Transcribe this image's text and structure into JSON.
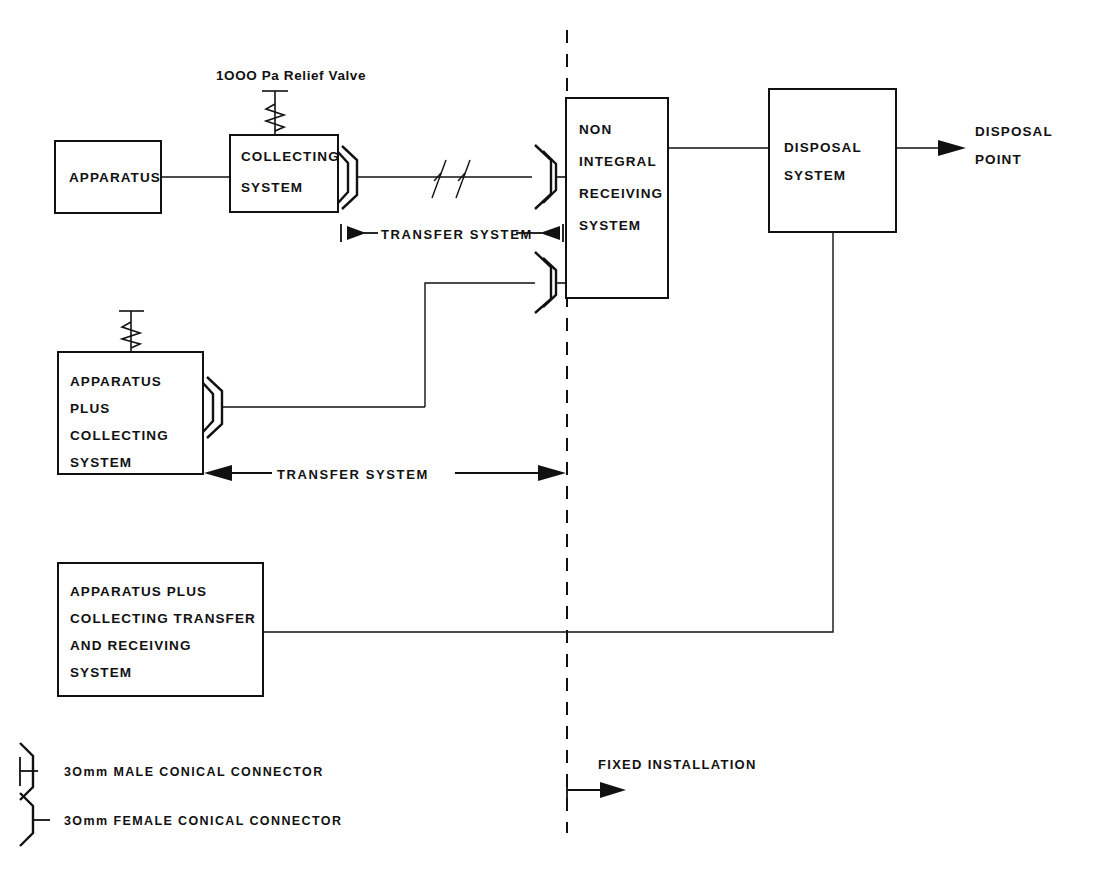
{
  "diagram": {
    "ink_color": "#111111",
    "background_color": "#ffffff"
  },
  "annotations": {
    "relief_valve_label": "1OOO Pa  Relief Valve",
    "fixed_installation_label": "FIXED INSTALLATION",
    "transfer_system_upper": "TRANSFER  SYSTEM",
    "transfer_system_lower": "TRANSFER  SYSTEM",
    "disposal_point_line1": "DISPOSAL",
    "disposal_point_line2": "POINT"
  },
  "boxes": [
    {
      "id": "apparatus",
      "lines": [
        "APPARATUS"
      ]
    },
    {
      "id": "collecting-system",
      "lines": [
        "COLLECTING",
        "SYSTEM"
      ]
    },
    {
      "id": "non-integral-receiving-system",
      "lines": [
        "NON",
        "INTEGRAL",
        "RECEIVING",
        "SYSTEM"
      ]
    },
    {
      "id": "disposal-system",
      "lines": [
        "DISPOSAL",
        "SYSTEM"
      ]
    },
    {
      "id": "apparatus-plus-collecting-system",
      "lines": [
        "APPARATUS",
        "PLUS",
        "COLLECTING",
        "SYSTEM"
      ]
    },
    {
      "id": "apparatus-plus-collecting-transfer-and-receiving-system",
      "lines": [
        "APPARATUS PLUS",
        "COLLECTING TRANSFER",
        "AND  RECEIVING",
        "SYSTEM"
      ]
    }
  ],
  "box_text": {
    "apparatus": "APPARATUS",
    "collecting_l1": "COLLECTING",
    "collecting_l2": "SYSTEM",
    "receiving_l1": "NON",
    "receiving_l2": "INTEGRAL",
    "receiving_l3": "RECEIVING",
    "receiving_l4": "SYSTEM",
    "disposal_l1": "DISPOSAL",
    "disposal_l2": "SYSTEM",
    "apc_l1": "APPARATUS",
    "apc_l2": "PLUS",
    "apc_l3": "COLLECTING",
    "apc_l4": "SYSTEM",
    "apctr_l1": "APPARATUS  PLUS",
    "apctr_l2": "COLLECTING TRANSFER",
    "apctr_l3": "AND  RECEIVING",
    "apctr_l4": "SYSTEM"
  },
  "legend": {
    "items": [
      {
        "symbol": "male-conical-connector-icon",
        "label": "3Omm  MALE  CONICAL  CONNECTOR"
      },
      {
        "symbol": "female-conical-connector-icon",
        "label": "3Omm  FEMALE  CONICAL  CONNECTOR"
      }
    ],
    "male_label": "3Omm  MALE  CONICAL  CONNECTOR",
    "female_label": "3Omm  FEMALE  CONICAL  CONNECTOR"
  }
}
